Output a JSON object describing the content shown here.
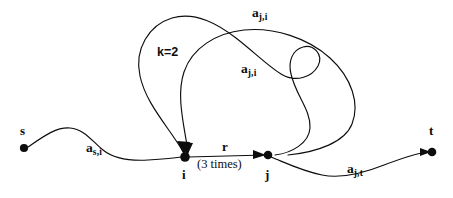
{
  "figure": {
    "kind": "directed-multigraph-walk",
    "background_color": "#ffffff",
    "stroke_color": "#0d0d0d",
    "width": 453,
    "height": 198
  },
  "nodes": [
    {
      "id": "s",
      "label": "s",
      "x": 24,
      "y": 148
    },
    {
      "id": "i",
      "label": "i",
      "x": 185,
      "y": 157
    },
    {
      "id": "j",
      "label": "j",
      "x": 268,
      "y": 155
    },
    {
      "id": "t",
      "label": "t",
      "x": 432,
      "y": 152
    }
  ],
  "edge_labels": {
    "s_i": {
      "base": "a",
      "sub": "s,i"
    },
    "j_i_outer": {
      "base": "a",
      "sub": "j,i"
    },
    "j_i_inner": {
      "base": "a",
      "sub": "j,i"
    },
    "j_t": {
      "base": "a",
      "sub": "j,t"
    }
  },
  "annotations": {
    "multiplicity": "k=2",
    "center_edge": "r",
    "center_edge_repeat": "(3 times)"
  },
  "labels": [
    {
      "name": "node-label-s",
      "text": "s"
    },
    {
      "name": "node-label-i",
      "text": "i"
    },
    {
      "name": "node-label-j",
      "text": "j"
    },
    {
      "name": "node-label-t",
      "text": "t"
    }
  ]
}
